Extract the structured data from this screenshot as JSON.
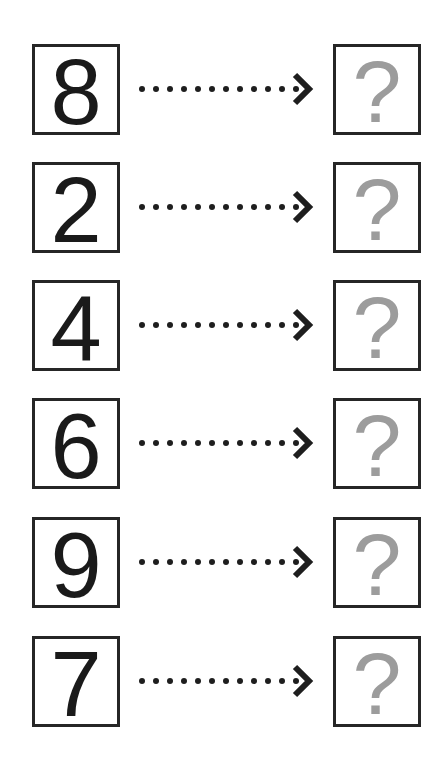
{
  "diagram": {
    "rows": [
      {
        "input": "8",
        "output": "?"
      },
      {
        "input": "2",
        "output": "?"
      },
      {
        "input": "4",
        "output": "?"
      },
      {
        "input": "6",
        "output": "?"
      },
      {
        "input": "9",
        "output": "?"
      },
      {
        "input": "7",
        "output": "?"
      }
    ],
    "arrow": {
      "style": "dotted",
      "dot_count": 12,
      "head": "chevron-right"
    },
    "colors": {
      "border": "#262626",
      "digit": "#1a1a1a",
      "question_mark": "#9c9c9c",
      "dots": "#1e1e1e",
      "background": "#ffffff"
    }
  }
}
